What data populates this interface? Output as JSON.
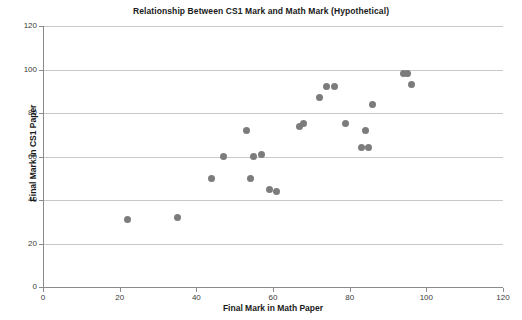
{
  "chart_data": {
    "type": "scatter",
    "title": "Relationship Between CS1 Mark and Math Mark (Hypothetical)",
    "xlabel": "Final Mark in Math Paper",
    "ylabel": "Final Mark in CS1 Paper",
    "xlim": [
      0,
      120
    ],
    "ylim": [
      0,
      120
    ],
    "xticks": [
      0,
      20,
      40,
      60,
      80,
      100,
      120
    ],
    "yticks": [
      0,
      20,
      40,
      60,
      80,
      100,
      120
    ],
    "grid": "horizontal",
    "legend": null,
    "marker_color": "#7c7c7c",
    "series": [
      {
        "name": "Students",
        "points": [
          [
            22,
            31
          ],
          [
            35,
            32
          ],
          [
            44,
            50
          ],
          [
            47,
            60
          ],
          [
            53,
            72
          ],
          [
            54,
            50
          ],
          [
            55,
            60
          ],
          [
            57,
            61
          ],
          [
            59,
            45
          ],
          [
            61,
            44
          ],
          [
            67,
            74
          ],
          [
            68,
            75
          ],
          [
            72,
            87
          ],
          [
            74,
            92
          ],
          [
            76,
            92
          ],
          [
            79,
            75
          ],
          [
            83,
            64
          ],
          [
            84,
            72
          ],
          [
            85,
            64
          ],
          [
            86,
            84
          ],
          [
            94,
            98
          ],
          [
            95,
            98
          ],
          [
            96,
            93
          ]
        ]
      }
    ]
  }
}
